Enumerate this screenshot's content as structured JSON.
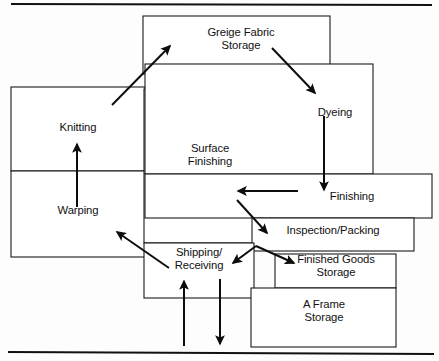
{
  "diagram": {
    "style": {
      "line_color": "#111111",
      "box_fill": "#ffffff",
      "background": "#fdfdfd"
    },
    "rules": [
      {
        "name": "top-rule",
        "x1": 11,
        "y1": 4,
        "x2": 432,
        "y2": 5
      },
      {
        "name": "bottom-rule",
        "x1": 8,
        "y1": 352,
        "x2": 434,
        "y2": 354
      }
    ],
    "areas": [
      {
        "id": "greige-fabric-storage",
        "label": "Greige Fabric\nStorage",
        "x": 143,
        "y": 16,
        "w": 187,
        "h": 58,
        "label_x": 186,
        "label_y": 26,
        "label_w": 110
      },
      {
        "id": "knitting",
        "label": "Knitting",
        "x": 11,
        "y": 87,
        "w": 134,
        "h": 84,
        "label_x": 35,
        "label_y": 121,
        "label_w": 86
      },
      {
        "id": "warping",
        "label": "Warping",
        "x": 11,
        "y": 171,
        "w": 134,
        "h": 86,
        "label_x": 33,
        "label_y": 204,
        "label_w": 90
      },
      {
        "id": "surface-finishing",
        "label": "Surface\nFinishing",
        "x": 144,
        "y": 89,
        "w": 131,
        "h": 154,
        "label_x": 166,
        "label_y": 142,
        "label_w": 88
      },
      {
        "id": "dyeing",
        "label": "Dyeing",
        "x": 145,
        "y": 64,
        "w": 228,
        "h": 110,
        "label_x": 296,
        "label_y": 106,
        "label_w": 78
      },
      {
        "id": "finishing",
        "label": "Finishing",
        "x": 145,
        "y": 174,
        "w": 287,
        "h": 44,
        "label_x": 310,
        "label_y": 190,
        "label_w": 84
      },
      {
        "id": "inspection-packing",
        "label": "Inspection/Packing",
        "x": 252,
        "y": 218,
        "w": 162,
        "h": 33,
        "label_x": 255,
        "label_y": 224,
        "label_w": 156
      },
      {
        "id": "shipping-receiving",
        "label": "Shipping/\nReceiving",
        "x": 144,
        "y": 243,
        "w": 110,
        "h": 55,
        "label_x": 159,
        "label_y": 246,
        "label_w": 80
      },
      {
        "id": "finished-goods-storage",
        "label": "Finished Goods\nStorage",
        "x": 275,
        "y": 254,
        "w": 121,
        "h": 34,
        "label_x": 277,
        "label_y": 253,
        "label_w": 118
      },
      {
        "id": "a-frame-storage",
        "label": "A Frame\nStorage",
        "x": 251,
        "y": 288,
        "w": 145,
        "h": 59,
        "label_x": 275,
        "label_y": 298,
        "label_w": 98
      }
    ],
    "flows": [
      {
        "id": "warping-to-knitting",
        "from": "Warping",
        "to": "Knitting",
        "kind": "arrow",
        "x1": 77,
        "y1": 207,
        "x2": 77,
        "y2": 144
      },
      {
        "id": "surface-finishing-to-greige",
        "from": "Surface Finishing",
        "to": "Greige Fabric Storage",
        "kind": "arrow",
        "x1": 112,
        "y1": 105,
        "x2": 170,
        "y2": 46
      },
      {
        "id": "greige-to-dyeing",
        "from": "Greige Fabric Storage",
        "to": "Dyeing",
        "kind": "arrow",
        "x1": 272,
        "y1": 48,
        "x2": 315,
        "y2": 93
      },
      {
        "id": "dyeing-to-finishing",
        "from": "Dyeing",
        "to": "Finishing",
        "kind": "arrow",
        "x1": 324,
        "y1": 116,
        "x2": 324,
        "y2": 190
      },
      {
        "id": "finishing-to-surface-finishing",
        "from": "Finishing",
        "to": "Surface Finishing",
        "kind": "arrow",
        "x1": 298,
        "y1": 191,
        "x2": 238,
        "y2": 191
      },
      {
        "id": "surface-finishing-to-inspection",
        "from": "Surface Finishing",
        "to": "Inspection/Packing",
        "kind": "arrow",
        "x1": 237,
        "y1": 200,
        "x2": 267,
        "y2": 233
      },
      {
        "id": "inspection-to-shipping",
        "from": "Inspection/Packing",
        "to": "Shipping/Receiving",
        "kind": "arrow",
        "x1": 256,
        "y1": 246,
        "x2": 233,
        "y2": 263
      },
      {
        "id": "inspection-to-finished-goods",
        "from": "Inspection/Packing",
        "to": "Finished Goods Storage",
        "kind": "arrow",
        "x1": 256,
        "y1": 246,
        "x2": 294,
        "y2": 263
      },
      {
        "id": "shipping-to-warping",
        "from": "Shipping/Receiving",
        "to": "Warping",
        "kind": "arrow",
        "x1": 169,
        "y1": 268,
        "x2": 117,
        "y2": 232
      },
      {
        "id": "inbound-to-shipping",
        "from": "External inbound",
        "to": "Shipping/Receiving",
        "kind": "arrow",
        "x1": 184,
        "y1": 346,
        "x2": 184,
        "y2": 281
      },
      {
        "id": "shipping-outbound",
        "from": "Shipping/Receiving",
        "to": "External outbound",
        "kind": "arrow",
        "x1": 220,
        "y1": 279,
        "x2": 220,
        "y2": 344
      }
    ]
  }
}
